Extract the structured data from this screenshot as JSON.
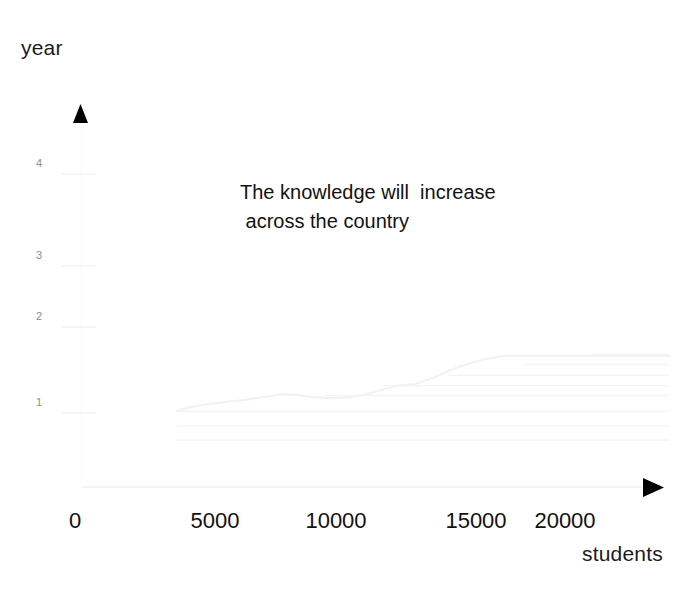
{
  "axes": {
    "y_title": "year",
    "x_title": "students",
    "y_ticks": [
      {
        "label": "4",
        "y": 164
      },
      {
        "label": "3",
        "y": 256
      },
      {
        "label": "2",
        "y": 317
      },
      {
        "label": "1",
        "y": 403
      }
    ],
    "x_ticks": [
      {
        "label": "0",
        "x": 75
      },
      {
        "label": "5000",
        "x": 215
      },
      {
        "label": "10000",
        "x": 336
      },
      {
        "label": "15000",
        "x": 476
      },
      {
        "label": "20000",
        "x": 565
      }
    ]
  },
  "annotation": {
    "text": "The knowledge will  increase\n across the country"
  },
  "icons": {
    "y_arrow": "up-triangle-arrow-icon",
    "x_arrow": "right-triangle-arrow-icon"
  },
  "colors": {
    "text": "#111111",
    "tick_y_text": "#8e8e8e",
    "axis_line": "#f0f0f0",
    "gridline": "#f3f3f3",
    "series_line": "#f2f2f2",
    "arrow": "#000000",
    "background": "#ffffff"
  },
  "chart_data": {
    "type": "line",
    "title": "",
    "subtitle": "",
    "xlabel": "students",
    "ylabel": "year",
    "xlim": [
      0,
      23500
    ],
    "ylim": [
      0,
      4.6
    ],
    "grid": true,
    "legend": "none",
    "annotations": [
      {
        "text": "The knowledge will  increase across the country",
        "x": 9000,
        "y": 3.5
      }
    ],
    "xticks": [
      0,
      5000,
      10000,
      15000,
      20000
    ],
    "yticks": [
      1,
      2,
      3,
      4
    ],
    "series": [
      {
        "name": "knowledge growth",
        "x": [
          3800,
          4300,
          5000,
          5800,
          6600,
          7400,
          8000,
          8600,
          9300,
          10000,
          10700,
          11400,
          12000,
          12600,
          13300,
          14000,
          14700,
          15400,
          16100,
          16800,
          23400
        ],
        "y": [
          0.97,
          1.02,
          1.06,
          1.09,
          1.12,
          1.16,
          1.19,
          1.18,
          1.15,
          1.14,
          1.15,
          1.19,
          1.25,
          1.3,
          1.32,
          1.4,
          1.5,
          1.58,
          1.64,
          1.68,
          1.68
        ]
      }
    ],
    "gridlines": [
      {
        "y_value": 1.7,
        "x_start": 20300,
        "x_end": 23400
      },
      {
        "y_value": 1.57,
        "x_start": 17600,
        "x_end": 23400
      },
      {
        "y_value": 1.43,
        "x_start": 14600,
        "x_end": 23400
      },
      {
        "y_value": 1.3,
        "x_start": 12000,
        "x_end": 23400
      },
      {
        "y_value": 1.17,
        "x_start": 9700,
        "x_end": 23400
      },
      {
        "y_value": 0.97,
        "x_start": 3800,
        "x_end": 23400
      },
      {
        "y_value": 0.78,
        "x_start": 3800,
        "x_end": 23400
      },
      {
        "y_value": 0.6,
        "x_start": 3800,
        "x_end": 23400
      }
    ]
  }
}
